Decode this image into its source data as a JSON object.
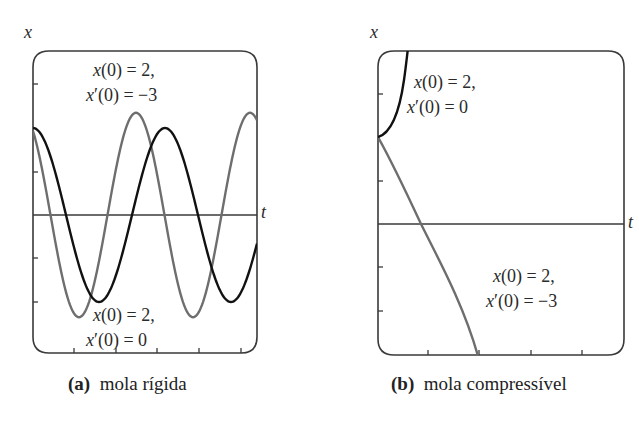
{
  "chart_data": [
    {
      "type": "line",
      "panel": "a",
      "caption_letter": "(a)",
      "caption_text": "mola rígida",
      "xlabel": "t",
      "ylabel": "x",
      "grid": false,
      "yticks": [
        -2,
        -1,
        1,
        3
      ],
      "xticks_count": 5,
      "ylim": [
        -3,
        3.7
      ],
      "series": [
        {
          "name": "x(0) = 2, x'(0) = -3",
          "color": "#6e6e6e",
          "initial_conditions": {
            "x0": 2,
            "v0": -3
          },
          "description": "periodic oscillation, amplitude ~2.35, shorter period",
          "amplitude": 2.35,
          "period_px": 114
        },
        {
          "name": "x(0) = 2, x'(0) = 0",
          "color": "#111111",
          "initial_conditions": {
            "x0": 2,
            "v0": 0
          },
          "description": "periodic oscillation, amplitude 2, longer period",
          "amplitude": 2,
          "period_px": 132
        }
      ],
      "annotations": [
        {
          "line1": "x(0) = 2,",
          "line2": "x′(0) = −3",
          "position": "top"
        },
        {
          "line1": "x(0) = 2,",
          "line2": "x′(0) = 0",
          "position": "bottom"
        }
      ]
    },
    {
      "type": "line",
      "panel": "b",
      "caption_letter": "(b)",
      "caption_text": "mola compressível",
      "xlabel": "t",
      "ylabel": "x",
      "grid": false,
      "yticks": [
        -2,
        -1,
        1,
        3
      ],
      "xticks_count": 4,
      "ylim": [
        -3,
        4
      ],
      "series": [
        {
          "name": "x(0) = 2, x'(0) = 0",
          "color": "#111111",
          "initial_conditions": {
            "x0": 2,
            "v0": 0
          },
          "description": "grows rapidly without bound (leaves plot top)"
        },
        {
          "name": "x(0) = 2, x'(0) = -3",
          "color": "#6e6e6e",
          "initial_conditions": {
            "x0": 2,
            "v0": -3
          },
          "description": "decreases through zero and falls without bound"
        }
      ],
      "annotations": [
        {
          "line1": "x(0) = 2,",
          "line2": "x′(0) = 0",
          "position": "top"
        },
        {
          "line1": "x(0) = 2,",
          "line2": "x′(0) = −3",
          "position": "bottom"
        }
      ]
    }
  ],
  "panels": {
    "a": {
      "ylabel": "x",
      "xlabel": "t",
      "annot_top": {
        "l1_pre": "x",
        "l1_post": "(0) = 2,",
        "l2_pre": "x",
        "l2_post": "′(0) = −3"
      },
      "annot_bottom": {
        "l1_pre": "x",
        "l1_post": "(0) = 2,",
        "l2_pre": "x",
        "l2_post": "′(0) = 0"
      },
      "caption_letter": "(a)",
      "caption_text": "mola rígida"
    },
    "b": {
      "ylabel": "x",
      "xlabel": "t",
      "annot_top": {
        "l1_pre": "x",
        "l1_post": "(0) = 2,",
        "l2_pre": "x",
        "l2_post": "′(0) = 0"
      },
      "annot_bottom": {
        "l1_pre": "x",
        "l1_post": "(0) = 2,",
        "l2_pre": "x",
        "l2_post": "′(0) = −3"
      },
      "caption_letter": "(b)",
      "caption_text": "mola compressível"
    }
  },
  "colors": {
    "frame": "#3a3a3a",
    "black_curve": "#111111",
    "gray_curve": "#6e6e6e"
  }
}
